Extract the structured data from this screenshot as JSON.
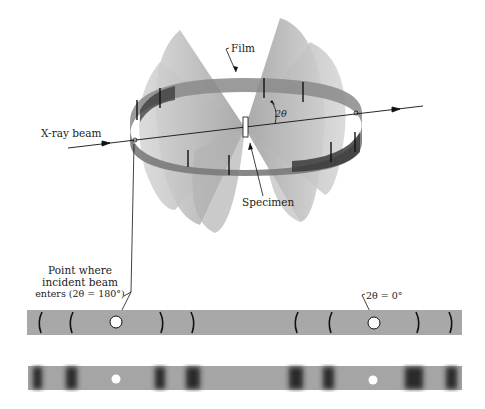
{
  "figure": {
    "type": "debye-scherrer-powder-camera",
    "labels": {
      "film": "Film",
      "two_theta": "2θ",
      "xray_beam": "X-ray beam",
      "specimen": "Specimen",
      "entry_point_line1": "Point where",
      "entry_point_line2": "incident beam",
      "entry_point_line3": "enters (2θ = 180°)",
      "exit_point": "2θ = 0°"
    },
    "strips": [
      {
        "name": "schematic-film-strip",
        "style": "line-arcs"
      },
      {
        "name": "exposed-film-strip",
        "style": "blurred-bands"
      }
    ],
    "colors": {
      "film_gray": "#a8a8a8",
      "cone_gray": "#b5b5b5",
      "line_dark": "#1a1a1a"
    }
  }
}
